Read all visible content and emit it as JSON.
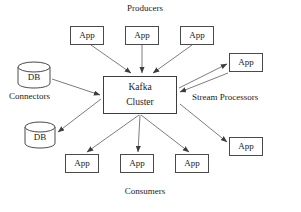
{
  "diagram": {
    "background_color": "#ffffff",
    "stroke_color": "#4a4a4a",
    "text_color": "#1a1a1a",
    "hub": {
      "line1": "Kafka",
      "line2": "Cluster"
    },
    "group_labels": {
      "producers": "Producers",
      "consumers": "Consumers",
      "connectors": "Connectors",
      "stream_processors": "Stream Processors"
    },
    "producers": [
      {
        "label": "App"
      },
      {
        "label": "App"
      },
      {
        "label": "App"
      }
    ],
    "consumers": [
      {
        "label": "App"
      },
      {
        "label": "App"
      },
      {
        "label": "App"
      }
    ],
    "stream_processors": [
      {
        "label": "App"
      },
      {
        "label": "App"
      }
    ],
    "connectors": [
      {
        "label": "DB"
      },
      {
        "label": "DB"
      }
    ]
  }
}
